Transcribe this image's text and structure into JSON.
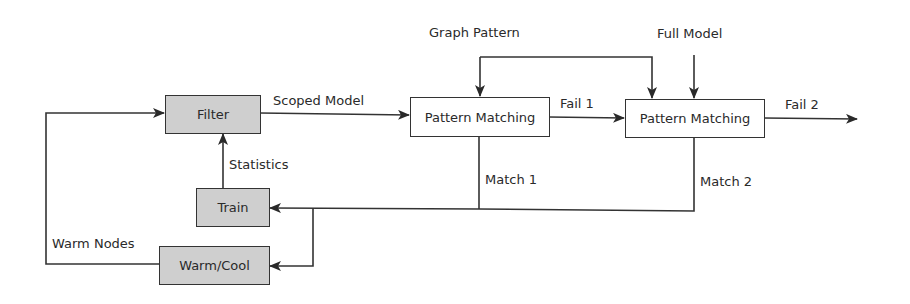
{
  "diagram": {
    "type": "flowchart",
    "colors": {
      "stroke": "#333333",
      "process_fill": "#cfcfcf",
      "matcher_fill": "#ffffff",
      "background": "#ffffff"
    },
    "nodes": {
      "filter": {
        "label": "Filter",
        "style": "gray"
      },
      "train": {
        "label": "Train",
        "style": "gray"
      },
      "warm_cool": {
        "label": "Warm/Cool",
        "style": "gray"
      },
      "pattern_matching_1": {
        "label": "Pattern Matching",
        "style": "white"
      },
      "pattern_matching_2": {
        "label": "Pattern Matching",
        "style": "white"
      }
    },
    "edge_labels": {
      "scoped_model": "Scoped Model",
      "statistics": "Statistics",
      "warm_nodes": "Warm Nodes",
      "graph_pattern": "Graph Pattern",
      "full_model": "Full Model",
      "fail_1": "Fail 1",
      "fail_2": "Fail 2",
      "match_1": "Match 1",
      "match_2": "Match 2"
    },
    "edges": [
      {
        "from": "filter",
        "to": "pattern_matching_1",
        "label": "Scoped Model"
      },
      {
        "from": "train",
        "to": "filter",
        "label": "Statistics"
      },
      {
        "from": "warm_cool",
        "to": "filter",
        "label": "Warm Nodes"
      },
      {
        "from": "graph_pattern_input",
        "to": "pattern_matching_1",
        "label": "Graph Pattern"
      },
      {
        "from": "graph_pattern_input",
        "to": "pattern_matching_2",
        "label": "Graph Pattern"
      },
      {
        "from": "full_model_input",
        "to": "pattern_matching_2",
        "label": "Full Model"
      },
      {
        "from": "pattern_matching_1",
        "to": "pattern_matching_2",
        "label": "Fail 1"
      },
      {
        "from": "pattern_matching_2",
        "to": "output",
        "label": "Fail 2"
      },
      {
        "from": "pattern_matching_1",
        "to": "train",
        "label": "Match 1"
      },
      {
        "from": "pattern_matching_2",
        "to": "train",
        "label": "Match 2"
      },
      {
        "from": "match_bus",
        "to": "warm_cool",
        "label": ""
      }
    ]
  }
}
